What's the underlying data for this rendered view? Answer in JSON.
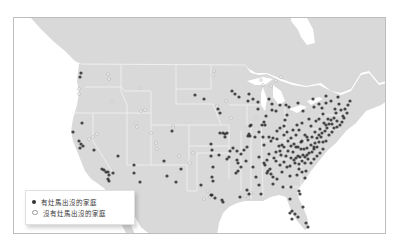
{
  "map": {
    "colors": {
      "land": "#d9d9d9",
      "water": "#ffffff",
      "border": "#f4f4f4",
      "point_present": "#2b2b2b",
      "point_absent": "#ffffff",
      "point_absent_stroke": "#9a9a9a"
    },
    "legend": {
      "items": [
        {
          "label": "有灶馬出沒的家庭",
          "style": "filled"
        },
        {
          "label": "沒有灶馬出沒的家庭",
          "style": "hollow"
        }
      ]
    },
    "points_present": [
      [
        80,
        72
      ],
      [
        79,
        76
      ],
      [
        81,
        122
      ],
      [
        72,
        131
      ],
      [
        78,
        140
      ],
      [
        80,
        143
      ],
      [
        82,
        145
      ],
      [
        79,
        147
      ],
      [
        93,
        149
      ],
      [
        117,
        155
      ],
      [
        101,
        168
      ],
      [
        103,
        169
      ],
      [
        105,
        171
      ],
      [
        107,
        171
      ],
      [
        108,
        174
      ],
      [
        112,
        172
      ],
      [
        107,
        178
      ],
      [
        108,
        180
      ],
      [
        133,
        164
      ],
      [
        133,
        172
      ],
      [
        139,
        181
      ],
      [
        163,
        160
      ],
      [
        166,
        175
      ],
      [
        175,
        181
      ],
      [
        180,
        168
      ],
      [
        171,
        130
      ],
      [
        194,
        94
      ],
      [
        203,
        98
      ],
      [
        217,
        108
      ],
      [
        219,
        112
      ],
      [
        231,
        90
      ],
      [
        234,
        93
      ],
      [
        238,
        96
      ],
      [
        248,
        93
      ],
      [
        247,
        100
      ],
      [
        252,
        98
      ],
      [
        257,
        108
      ],
      [
        257,
        101
      ],
      [
        250,
        124
      ],
      [
        249,
        125
      ],
      [
        219,
        132
      ],
      [
        222,
        132
      ],
      [
        224,
        133
      ],
      [
        226,
        132
      ],
      [
        224,
        136
      ],
      [
        210,
        143
      ],
      [
        211,
        149
      ],
      [
        210,
        155
      ],
      [
        212,
        166
      ],
      [
        211,
        176
      ],
      [
        212,
        180
      ],
      [
        211,
        194
      ],
      [
        210,
        194
      ],
      [
        214,
        197
      ],
      [
        221,
        199
      ],
      [
        222,
        201
      ],
      [
        200,
        184
      ],
      [
        232,
        147
      ],
      [
        229,
        150
      ],
      [
        228,
        156
      ],
      [
        226,
        158
      ],
      [
        218,
        154
      ],
      [
        236,
        150
      ],
      [
        236,
        159
      ],
      [
        237,
        162
      ],
      [
        237,
        170
      ],
      [
        235,
        172
      ],
      [
        240,
        153
      ],
      [
        243,
        149
      ],
      [
        246,
        146
      ],
      [
        247,
        135
      ],
      [
        249,
        135
      ],
      [
        248,
        133
      ],
      [
        254,
        136
      ],
      [
        258,
        131
      ],
      [
        261,
        124
      ],
      [
        263,
        121
      ],
      [
        262,
        136
      ],
      [
        268,
        136
      ],
      [
        270,
        140
      ],
      [
        272,
        137
      ],
      [
        276,
        138
      ],
      [
        276,
        130
      ],
      [
        279,
        127
      ],
      [
        283,
        125
      ],
      [
        275,
        110
      ],
      [
        279,
        104
      ],
      [
        285,
        104
      ],
      [
        288,
        106
      ],
      [
        286,
        114
      ],
      [
        284,
        119
      ],
      [
        265,
        115
      ],
      [
        264,
        124
      ],
      [
        271,
        109
      ],
      [
        271,
        103
      ],
      [
        268,
        98
      ],
      [
        258,
        156
      ],
      [
        263,
        162
      ],
      [
        264,
        164
      ],
      [
        266,
        172
      ],
      [
        267,
        170
      ],
      [
        270,
        173
      ],
      [
        269,
        168
      ],
      [
        266,
        159
      ],
      [
        272,
        176
      ],
      [
        255,
        176
      ],
      [
        258,
        184
      ],
      [
        246,
        189
      ],
      [
        260,
        193
      ],
      [
        239,
        196
      ],
      [
        248,
        193
      ],
      [
        280,
        154
      ],
      [
        283,
        161
      ],
      [
        286,
        166
      ],
      [
        289,
        165
      ],
      [
        293,
        159
      ],
      [
        292,
        151
      ],
      [
        295,
        146
      ],
      [
        300,
        141
      ],
      [
        304,
        134
      ],
      [
        307,
        139
      ],
      [
        310,
        125
      ],
      [
        313,
        106
      ],
      [
        318,
        103
      ],
      [
        321,
        107
      ],
      [
        322,
        113
      ],
      [
        325,
        102
      ],
      [
        330,
        100
      ],
      [
        334,
        108
      ],
      [
        340,
        109
      ],
      [
        338,
        103
      ],
      [
        344,
        108
      ],
      [
        346,
        112
      ],
      [
        343,
        117
      ],
      [
        341,
        121
      ],
      [
        339,
        124
      ],
      [
        336,
        120
      ],
      [
        333,
        117
      ],
      [
        330,
        119
      ],
      [
        327,
        118
      ],
      [
        326,
        127
      ],
      [
        324,
        130
      ],
      [
        321,
        132
      ],
      [
        318,
        134
      ],
      [
        316,
        137
      ],
      [
        314,
        142
      ],
      [
        313,
        146
      ],
      [
        313,
        148
      ],
      [
        311,
        151
      ],
      [
        308,
        152
      ],
      [
        306,
        154
      ],
      [
        304,
        156
      ],
      [
        302,
        154
      ],
      [
        299,
        156
      ],
      [
        297,
        155
      ],
      [
        295,
        157
      ],
      [
        300,
        148
      ],
      [
        303,
        148
      ],
      [
        306,
        147
      ],
      [
        310,
        144
      ],
      [
        316,
        146
      ],
      [
        318,
        141
      ],
      [
        320,
        136
      ],
      [
        322,
        141
      ],
      [
        325,
        140
      ],
      [
        328,
        134
      ],
      [
        331,
        131
      ],
      [
        333,
        127
      ],
      [
        336,
        126
      ],
      [
        331,
        123
      ],
      [
        328,
        123
      ],
      [
        325,
        124
      ],
      [
        323,
        122
      ],
      [
        319,
        128
      ],
      [
        314,
        131
      ],
      [
        311,
        136
      ],
      [
        306,
        136
      ],
      [
        301,
        140
      ],
      [
        297,
        146
      ],
      [
        293,
        143
      ],
      [
        290,
        145
      ],
      [
        287,
        150
      ],
      [
        285,
        155
      ],
      [
        290,
        157
      ],
      [
        294,
        162
      ],
      [
        298,
        163
      ],
      [
        301,
        160
      ],
      [
        304,
        162
      ],
      [
        307,
        158
      ],
      [
        310,
        162
      ],
      [
        313,
        158
      ],
      [
        316,
        155
      ],
      [
        319,
        152
      ],
      [
        322,
        148
      ],
      [
        305,
        170
      ],
      [
        301,
        171
      ],
      [
        298,
        168
      ],
      [
        296,
        174
      ],
      [
        304,
        177
      ],
      [
        289,
        175
      ],
      [
        282,
        186
      ],
      [
        290,
        186
      ],
      [
        298,
        190
      ],
      [
        299,
        193
      ],
      [
        289,
        198
      ],
      [
        291,
        210
      ],
      [
        294,
        213
      ],
      [
        289,
        212
      ],
      [
        291,
        218
      ],
      [
        297,
        216
      ],
      [
        302,
        206
      ],
      [
        305,
        222
      ],
      [
        307,
        226
      ],
      [
        279,
        150
      ],
      [
        281,
        144
      ],
      [
        283,
        146
      ],
      [
        287,
        140
      ],
      [
        290,
        137
      ],
      [
        295,
        134
      ],
      [
        298,
        129
      ],
      [
        301,
        122
      ],
      [
        296,
        124
      ],
      [
        292,
        129
      ],
      [
        286,
        131
      ],
      [
        283,
        134
      ],
      [
        263,
        144
      ],
      [
        268,
        153
      ],
      [
        273,
        157
      ],
      [
        275,
        151
      ],
      [
        278,
        145
      ],
      [
        275,
        160
      ],
      [
        279,
        164
      ],
      [
        281,
        171
      ],
      [
        276,
        178
      ],
      [
        272,
        183
      ],
      [
        315,
        120
      ],
      [
        318,
        118
      ],
      [
        342,
        115
      ],
      [
        347,
        104
      ],
      [
        335,
        112
      ],
      [
        337,
        96
      ],
      [
        349,
        100
      ],
      [
        325,
        95
      ],
      [
        312,
        98
      ],
      [
        308,
        118
      ],
      [
        302,
        110
      ],
      [
        297,
        102
      ],
      [
        252,
        166
      ],
      [
        245,
        160
      ],
      [
        240,
        166
      ]
    ],
    "points_absent": [
      [
        107,
        73
      ],
      [
        108,
        78
      ],
      [
        78,
        88
      ],
      [
        78,
        93
      ],
      [
        111,
        100
      ],
      [
        139,
        87
      ],
      [
        135,
        122
      ],
      [
        136,
        126
      ],
      [
        155,
        142
      ],
      [
        172,
        125
      ],
      [
        172,
        127
      ],
      [
        189,
        162
      ],
      [
        212,
        74
      ],
      [
        213,
        70
      ],
      [
        230,
        117
      ],
      [
        260,
        79
      ],
      [
        262,
        84
      ],
      [
        255,
        116
      ],
      [
        244,
        195
      ],
      [
        247,
        197
      ],
      [
        250,
        192
      ],
      [
        209,
        196
      ],
      [
        203,
        198
      ],
      [
        207,
        190
      ],
      [
        92,
        136
      ],
      [
        96,
        133
      ],
      [
        88,
        138
      ],
      [
        156,
        148
      ],
      [
        192,
        152
      ],
      [
        178,
        155
      ],
      [
        140,
        110
      ],
      [
        144,
        109
      ],
      [
        150,
        132
      ],
      [
        216,
        105
      ],
      [
        225,
        100
      ],
      [
        270,
        85
      ],
      [
        275,
        80
      ],
      [
        280,
        76
      ]
    ]
  }
}
